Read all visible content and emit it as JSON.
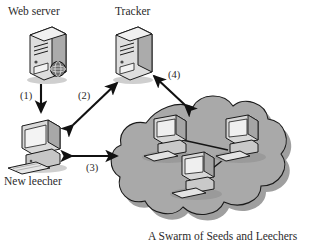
{
  "diagram": {
    "caption": "A Swarm of Seeds and Leechers",
    "nodes": {
      "web_server": {
        "label": "Web server",
        "icon": "server-tower-globe-icon"
      },
      "tracker": {
        "label": "Tracker",
        "icon": "server-tower-icon"
      },
      "new_leecher": {
        "label": "New leecher",
        "icon": "desktop-computer-icon"
      },
      "swarm": {
        "label": "A Swarm of Seeds and Leechers",
        "icon": "cloud-icon",
        "peer_count": 3
      }
    },
    "steps": [
      {
        "id": "1",
        "label": "(1)",
        "from": "web_server",
        "to": "new_leecher",
        "direction": "one-way"
      },
      {
        "id": "2",
        "label": "(2)",
        "from": "new_leecher",
        "to": "tracker",
        "direction": "two-way"
      },
      {
        "id": "3",
        "label": "(3)",
        "from": "new_leecher",
        "to": "swarm",
        "direction": "two-way"
      },
      {
        "id": "4",
        "label": "(4)",
        "from": "swarm",
        "to": "tracker",
        "direction": "two-way"
      }
    ],
    "colors": {
      "cloud_fill": "#a8a8a8",
      "cloud_stroke": "#1c1c1c",
      "cloud_shadow": "#8a8a8a",
      "device_light": "#e8e8e8",
      "device_mid": "#bdbdbd",
      "device_dark": "#8f8f8f",
      "ink": "#1c1c1c",
      "text": "#2b2b2b",
      "background": "#ffffff"
    }
  }
}
